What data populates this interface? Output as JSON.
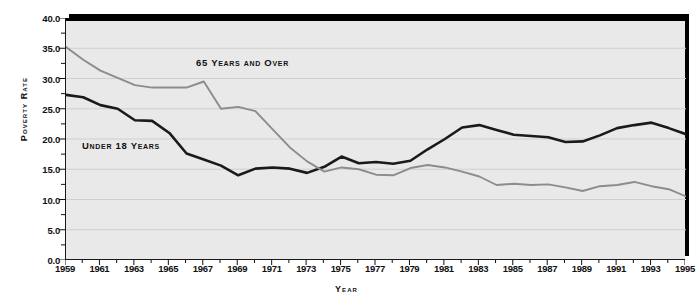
{
  "axes": {
    "y_title": "Poverty Rate",
    "x_title": "Year",
    "y_ticks": [
      "40.0",
      "35.0",
      "30.0",
      "25.0",
      "20.0",
      "15.0",
      "10.0",
      "5.0",
      "0.0"
    ],
    "x_ticks": [
      "1959",
      "1961",
      "1963",
      "1965",
      "1967",
      "1969",
      "1971",
      "1973",
      "1975",
      "1977",
      "1979",
      "1981",
      "1983",
      "1985",
      "1987",
      "1989",
      "1991",
      "1993",
      "1995"
    ]
  },
  "labels": {
    "over65": "65 Years and Over",
    "under18": "Under 18 Years"
  },
  "colors": {
    "under18_line": "#1a1a1a",
    "over65_line": "#8c8c8c",
    "plot_background": "#e9e9e9",
    "gridline": "#cfcfcf",
    "frame": "#000000"
  },
  "chart_data": {
    "type": "line",
    "title": "",
    "xlabel": "Year",
    "ylabel": "Poverty Rate",
    "xlim": [
      1959,
      1995
    ],
    "ylim": [
      0.0,
      40.0
    ],
    "ytick_interval": 5.0,
    "yminor_tick_interval": 2.5,
    "grid": true,
    "legend": "inline-annotations",
    "x": [
      1959,
      1960,
      1961,
      1962,
      1963,
      1964,
      1965,
      1966,
      1967,
      1968,
      1969,
      1970,
      1971,
      1972,
      1973,
      1974,
      1975,
      1976,
      1977,
      1978,
      1979,
      1980,
      1981,
      1982,
      1983,
      1984,
      1985,
      1986,
      1987,
      1988,
      1989,
      1990,
      1991,
      1992,
      1993,
      1994,
      1995
    ],
    "series": [
      {
        "name": "Under 18 Years",
        "color": "#1a1a1a",
        "values": [
          27.3,
          26.9,
          25.6,
          25.0,
          23.1,
          23.0,
          21.0,
          17.6,
          16.6,
          15.6,
          14.0,
          15.1,
          15.3,
          15.1,
          14.4,
          15.4,
          17.1,
          16.0,
          16.2,
          15.9,
          16.4,
          18.3,
          20.0,
          21.9,
          22.3,
          21.5,
          20.7,
          20.5,
          20.3,
          19.5,
          19.6,
          20.6,
          21.8,
          22.3,
          22.7,
          21.8,
          20.8
        ]
      },
      {
        "name": "65 Years and Over",
        "color": "#8c8c8c",
        "values": [
          35.2,
          33.1,
          31.3,
          30.1,
          28.9,
          28.5,
          28.5,
          28.5,
          29.5,
          25.0,
          25.3,
          24.6,
          21.6,
          18.6,
          16.3,
          14.6,
          15.3,
          15.0,
          14.1,
          14.0,
          15.2,
          15.7,
          15.3,
          14.6,
          13.8,
          12.4,
          12.6,
          12.4,
          12.5,
          12.0,
          11.4,
          12.2,
          12.4,
          12.9,
          12.2,
          11.7,
          10.5
        ]
      }
    ]
  }
}
